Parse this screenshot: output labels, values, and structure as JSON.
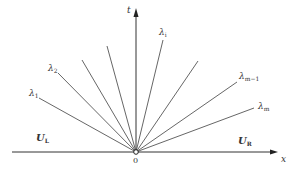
{
  "diagram": {
    "type": "riemann-fan",
    "colors": {
      "line": "#555555",
      "axis": "#333333",
      "text": "#333333",
      "background": "#ffffff"
    },
    "origin": {
      "x": 136,
      "y": 152,
      "label": "0"
    },
    "axes": {
      "x": {
        "label": "x",
        "from": 12,
        "to": 278
      },
      "t": {
        "label": "t",
        "from": 152,
        "to": 8
      }
    },
    "states": {
      "left": {
        "main": "U",
        "sub": "L"
      },
      "right": {
        "main": "U",
        "sub": "R"
      }
    },
    "waves": [
      {
        "name": "lambda-1",
        "label_main": "λ",
        "label_sub": "1",
        "end": [
          39,
          98
        ],
        "label_pos": [
          29,
          89
        ]
      },
      {
        "name": "lambda-2",
        "label_main": "λ",
        "label_sub": "2",
        "end": [
          58,
          73
        ],
        "label_pos": [
          48,
          64
        ]
      },
      {
        "name": "wave-3",
        "end": [
          82,
          60
        ]
      },
      {
        "name": "wave-4",
        "end": [
          107,
          46
        ]
      },
      {
        "name": "lambda-i",
        "label_main": "λ",
        "label_sub": "i",
        "end": [
          163,
          40
        ],
        "label_pos": [
          159,
          28
        ]
      },
      {
        "name": "wave-6",
        "end": [
          198,
          61
        ]
      },
      {
        "name": "lambda-m-1",
        "label_main": "λ",
        "label_sub": "m−1",
        "end": [
          237,
          82
        ],
        "label_pos": [
          239,
          72
        ]
      },
      {
        "name": "lambda-m",
        "label_main": "λ",
        "label_sub": "m",
        "end": [
          254,
          108
        ],
        "label_pos": [
          258,
          102
        ]
      }
    ]
  }
}
